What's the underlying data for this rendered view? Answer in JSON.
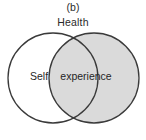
{
  "figure": {
    "panel_label": "(b)",
    "title": "Health",
    "background_color": "#ffffff"
  },
  "chart_data": {
    "type": "diagram",
    "diagram_type": "venn",
    "title": "Health",
    "panel_label": "(b)",
    "sets": [
      {
        "name": "Self",
        "label": "Self",
        "fill": "#ffffff",
        "stroke": "#3a3a3a",
        "cx": 53,
        "cy": 78,
        "r": 45,
        "label_x": 39,
        "label_y": 80
      },
      {
        "name": "Health",
        "label": "",
        "fill": "#dadada",
        "stroke": "#3a3a3a",
        "cx": 94,
        "cy": 78,
        "r": 45,
        "label_x": 0,
        "label_y": 0
      }
    ],
    "intersection": {
      "label": "experience",
      "fill": "#dadada",
      "label_x": 86,
      "label_y": 80
    },
    "legend": "none",
    "grid": false
  },
  "colors": {
    "shaded": "#dadada",
    "unshaded": "#ffffff",
    "outline": "#3a3a3a",
    "text": "#262626"
  }
}
